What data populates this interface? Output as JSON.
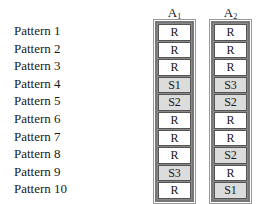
{
  "patterns": [
    "Pattern 1",
    "Pattern 2",
    "Pattern 3",
    "Pattern 4",
    "Pattern 5",
    "Pattern 6",
    "Pattern 7",
    "Pattern 8",
    "Pattern 9",
    "Pattern 10"
  ],
  "columns": [
    {
      "header_base": "A",
      "header_sub": "1",
      "cells": [
        "R",
        "R",
        "R",
        "S1",
        "S2",
        "R",
        "R",
        "R",
        "S3",
        "R"
      ]
    },
    {
      "header_base": "A",
      "header_sub": "2",
      "cells": [
        "R",
        "R",
        "R",
        "S3",
        "S2",
        "R",
        "R",
        "S2",
        "R",
        "S1"
      ]
    }
  ],
  "colors": {
    "regular_cell": "#ffffff",
    "special_cell": "#dcdcdc",
    "border": "#777777"
  }
}
